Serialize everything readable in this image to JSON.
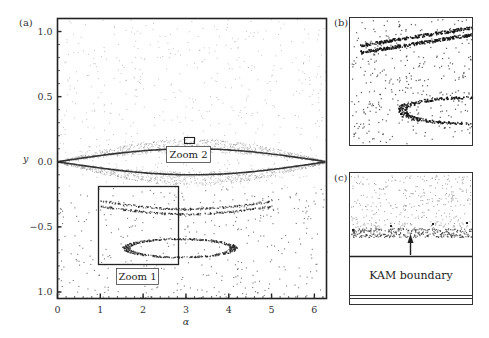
{
  "figure": {
    "panels": {
      "a": {
        "label": "(a)"
      },
      "b": {
        "label": "(b)"
      },
      "c": {
        "label": "(c)",
        "annotation": "KAM boundary"
      }
    },
    "zoom_boxes": [
      {
        "label": "Zoom 1",
        "alpha_range": [
          1.0,
          2.85
        ],
        "y_range": [
          -0.18,
          -0.76
        ]
      },
      {
        "label": "Zoom 2",
        "alpha_range": [
          3.0,
          3.25
        ],
        "y_range": [
          0.06,
          0.02
        ]
      }
    ]
  },
  "chart_data": {
    "type": "scatter",
    "title": "",
    "xlabel": "α",
    "ylabel": "y",
    "xlim": [
      0,
      6.2832
    ],
    "ylim": [
      -1.05,
      1.1
    ],
    "x_ticks": [
      "0",
      "1",
      "2",
      "3",
      "4",
      "5",
      "6"
    ],
    "y_ticks": [
      "1.0",
      "0.5",
      "0.0",
      "-0.5",
      "1.0"
    ],
    "grid": false,
    "legend": null,
    "features": [
      {
        "name": "separatrix-upper",
        "shape": "y = 0.10*sin(alpha/2)",
        "alpha_range": [
          0,
          6.2832
        ]
      },
      {
        "name": "separatrix-lower",
        "shape": "y = -0.10*sin(alpha/2)",
        "alpha_range": [
          0,
          6.2832
        ]
      },
      {
        "name": "resonance-band-upper",
        "y_approx": -0.33,
        "alpha_range": [
          1.0,
          5.0
        ]
      },
      {
        "name": "island-chain",
        "center": [
          2.8,
          -0.65
        ],
        "alpha_range": [
          1.6,
          4.1
        ]
      }
    ],
    "insets": [
      {
        "panel": "(b)",
        "content": "Magnified view of Zoom 1 region: two dense bands (upper band and island loop) surrounded by scattered points"
      },
      {
        "panel": "(c)",
        "content": "Magnified view of Zoom 2 region: scattered points above a dense layer, arrow pointing up from KAM boundary line",
        "annotation": "KAM boundary"
      }
    ]
  }
}
